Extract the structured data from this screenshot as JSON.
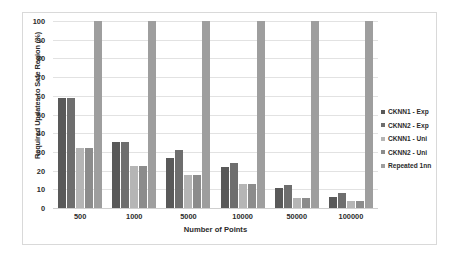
{
  "chart_data": {
    "type": "bar",
    "title": "",
    "xlabel": "Number of Points",
    "ylabel": "Required Updates to Safe Region (%)",
    "ylim": [
      0,
      100
    ],
    "ytick_step": 10,
    "yticks": [
      100,
      90,
      80,
      70,
      60,
      50,
      40,
      30,
      20,
      10,
      0
    ],
    "grid": true,
    "legend_position": "right",
    "categories": [
      "500",
      "1000",
      "5000",
      "10000",
      "50000",
      "100000"
    ],
    "series": [
      {
        "name": "CKNN1 - Exp",
        "color": "#595959",
        "values": [
          59,
          35.5,
          27,
          22,
          10.5,
          6
        ]
      },
      {
        "name": "CKNN2 - Exp",
        "color": "#6e6e6e",
        "values": [
          59,
          35.5,
          31,
          24,
          12.5,
          8
        ]
      },
      {
        "name": "CKNN1 - Uni",
        "color": "#b5b5b5",
        "values": [
          32,
          22.5,
          17.5,
          13,
          5.5,
          4
        ]
      },
      {
        "name": "CKNN2 - Uni",
        "color": "#8c8c8c",
        "values": [
          32,
          22.5,
          17.5,
          13,
          5.5,
          4
        ]
      },
      {
        "name": "Repeated 1nn",
        "color": "#9e9e9e",
        "values": [
          100,
          100,
          100,
          100,
          100,
          100
        ]
      }
    ]
  }
}
